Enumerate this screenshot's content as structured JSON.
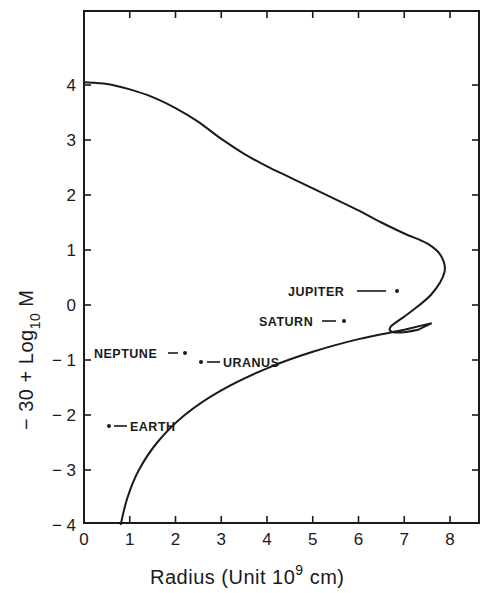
{
  "chart_data": {
    "type": "line",
    "title": "",
    "xlabel": "Radius (Unit 10^9 cm)",
    "xlabel_parts": {
      "main": "Radius (Unit 10",
      "sup": "9",
      "tail": " cm)"
    },
    "ylabel": "-30 + Log10 M",
    "ylabel_parts": {
      "main": "− 30 + Log",
      "sub": "10",
      "tail": " M"
    },
    "xlim": [
      0,
      8.6
    ],
    "ylim": [
      -4,
      5.2
    ],
    "x_ticks": [
      "0",
      "1",
      "2",
      "3",
      "4",
      "5",
      "6",
      "7",
      "8"
    ],
    "y_ticks": [
      "4",
      "3",
      "2",
      "1",
      "0",
      "-1",
      "-2",
      "-3",
      "-4"
    ],
    "grid": false,
    "legend": null,
    "series": [
      {
        "name": "mass-radius relation",
        "type": "line",
        "points": [
          [
            0.0,
            4.05
          ],
          [
            0.5,
            4.02
          ],
          [
            1.0,
            3.92
          ],
          [
            1.5,
            3.78
          ],
          [
            2.0,
            3.58
          ],
          [
            2.5,
            3.33
          ],
          [
            3.0,
            3.02
          ],
          [
            3.5,
            2.75
          ],
          [
            4.0,
            2.52
          ],
          [
            4.5,
            2.32
          ],
          [
            5.0,
            2.12
          ],
          [
            5.5,
            1.92
          ],
          [
            6.0,
            1.72
          ],
          [
            6.5,
            1.5
          ],
          [
            7.0,
            1.3
          ],
          [
            7.5,
            1.12
          ],
          [
            7.8,
            0.9
          ],
          [
            7.88,
            0.6
          ],
          [
            7.6,
            0.2
          ],
          [
            7.1,
            -0.15
          ],
          [
            6.7,
            -0.4
          ],
          [
            6.8,
            -0.5
          ],
          [
            7.3,
            -0.45
          ],
          [
            7.6,
            -0.33
          ],
          [
            7.0,
            -0.45
          ],
          [
            6.0,
            -0.62
          ],
          [
            5.0,
            -0.85
          ],
          [
            4.0,
            -1.15
          ],
          [
            3.0,
            -1.55
          ],
          [
            2.2,
            -2.0
          ],
          [
            1.6,
            -2.5
          ],
          [
            1.2,
            -3.0
          ],
          [
            0.95,
            -3.5
          ],
          [
            0.8,
            -4.0
          ]
        ]
      },
      {
        "name": "planets",
        "type": "scatter",
        "points": [
          {
            "label": "JUPITER",
            "x": 6.84,
            "y": 0.25
          },
          {
            "label": "SATURN",
            "x": 5.68,
            "y": -0.29
          },
          {
            "label": "NEPTUNE",
            "x": 2.21,
            "y": -0.87
          },
          {
            "label": "URANUS",
            "x": 2.56,
            "y": -1.04
          },
          {
            "label": "EARTH",
            "x": 0.55,
            "y": -2.2
          }
        ]
      }
    ]
  },
  "labels": {
    "jupiter": "JUPITER",
    "saturn": "SATURN",
    "neptune": "NEPTUNE",
    "uranus": "URANUS",
    "earth": "EARTH"
  }
}
